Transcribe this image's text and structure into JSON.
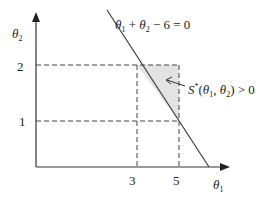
{
  "diagram": {
    "type": "region-plot",
    "axes": {
      "x": {
        "symbol": "θ",
        "subscript": "1",
        "ticks": [
          "3",
          "5"
        ]
      },
      "y": {
        "symbol": "θ",
        "subscript": "2",
        "ticks": [
          "1",
          "2"
        ]
      }
    },
    "line_label": {
      "t1": "θ",
      "s1": "1",
      "plus": " + ",
      "t2": "θ",
      "s2": "2",
      "rest": " − 6 = 0"
    },
    "region_label": {
      "S": "S",
      "sup": "*",
      "open": "(",
      "t1": "θ",
      "s1": "1",
      "comma": ", ",
      "t2": "θ",
      "s2": "2",
      "close": ") > 0"
    },
    "colors": {
      "shade": "#e3e3e3",
      "line": "#333333"
    }
  }
}
